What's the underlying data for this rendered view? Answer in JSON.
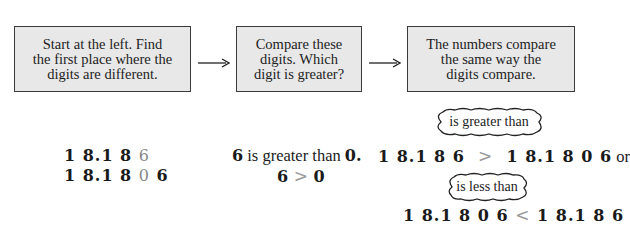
{
  "steps": [
    {
      "lines": [
        "Start at the left. Find",
        "the first place where the",
        "digits are different."
      ]
    },
    {
      "lines": [
        "Compare these",
        "digits. Which",
        "digit is greater?"
      ]
    },
    {
      "lines": [
        "The numbers compare",
        "the same way the",
        "digits compare."
      ]
    }
  ],
  "example": {
    "number_a": {
      "prefix": "1 8.1 8 ",
      "highlight": "6",
      "suffix": ""
    },
    "number_b": {
      "prefix": "1 8.1 8 ",
      "highlight": "0",
      "suffix": " 6"
    }
  },
  "digit_compare": {
    "sentence": {
      "d1": "6",
      "text": " is greater than ",
      "d2": "0."
    },
    "symbolic": {
      "d1": "6",
      "op": ">",
      "d2": "0"
    }
  },
  "result": {
    "greater_label": "is greater than",
    "greater": {
      "left": "1 8.1 8 6",
      "op": ">",
      "right": "1 8.1 8 0 6",
      "connector": " or"
    },
    "less_label": "is less than",
    "less": {
      "left": "1 8.1 8 0 6",
      "op": "<",
      "right": "1 8.1 8 6"
    }
  },
  "colors": {
    "box_fill": "#e8e8e8",
    "box_border": "#3a3a3a",
    "highlight_digit": "#888888"
  }
}
